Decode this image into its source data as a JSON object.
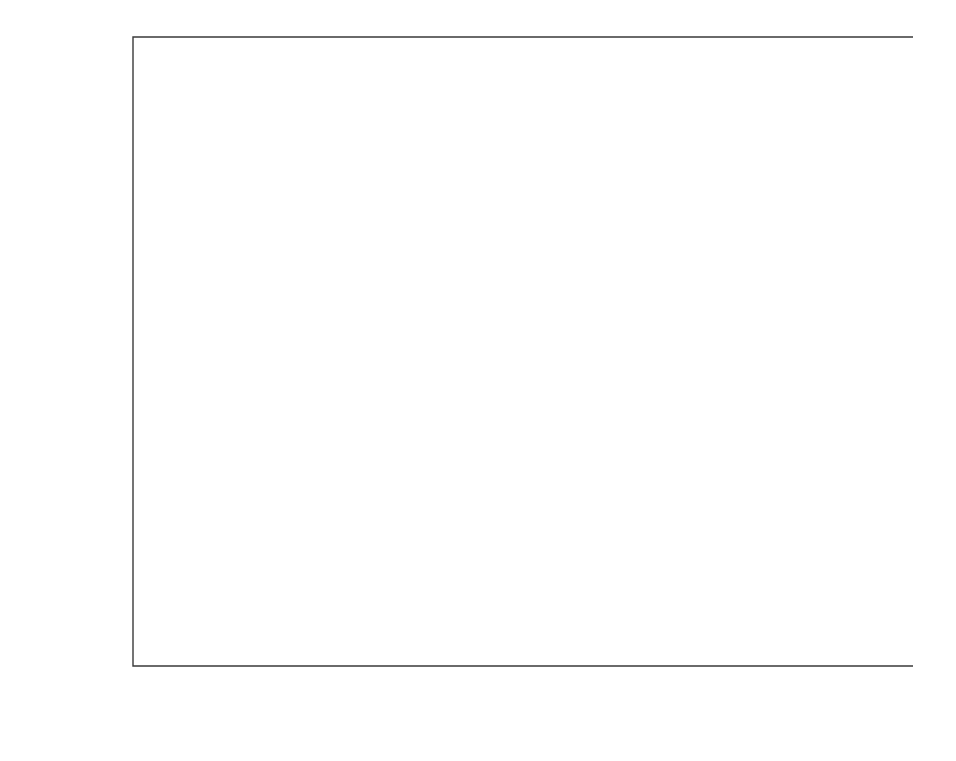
{
  "chart_data": {
    "type": "scatter",
    "title": "",
    "xlabel": "Experimental pressure (torr)",
    "ylabel": "Predicted pressure (torr)",
    "xlim": [
      0,
      232
    ],
    "ylim": [
      0,
      238
    ],
    "xticks": [
      0,
      50,
      100,
      150,
      200
    ],
    "yticks": [
      50,
      100,
      150,
      200
    ],
    "xtick_labels": [
      "0",
      "50",
      "100",
      "150",
      "200"
    ],
    "ytick_labels": [
      "50",
      "100",
      "150",
      "200"
    ],
    "grid": false,
    "legend_position": "lower-right",
    "reference_line": {
      "name": "parity line y = x",
      "from": [
        0,
        0
      ],
      "to": [
        232,
        232
      ]
    },
    "legend": [
      {
        "marker": "circle",
        "label": "NaBr – KBr"
      },
      {
        "marker": "square",
        "label": "NaCl – KCl"
      },
      {
        "marker": "triangle",
        "label": "NaCl – CaCl",
        "sub": "2"
      },
      {
        "marker": "dash",
        "label": "Pure water pressure"
      }
    ],
    "annotations": [
      {
        "text": "298.15K",
        "x": 23.6,
        "y": 23.6,
        "label_x": 20.5,
        "label_y": 23.6
      },
      {
        "text": "303.15 K",
        "x": 31.8,
        "y": 31.8,
        "label_x": 28.0,
        "label_y": 31.8
      },
      {
        "text": "308.15 K",
        "x": 42.2,
        "y": 42.2,
        "label_x": 38.0,
        "label_y": 42.2
      },
      {
        "text": "313.15K",
        "x": 55.3,
        "y": 55.3,
        "label_x": 51.5,
        "label_y": 55.3
      },
      {
        "text": "318.15K",
        "x": 71.9,
        "y": 71.9,
        "label_x": 67.0,
        "label_y": 71.9
      },
      {
        "text": "323.15K",
        "x": 92.5,
        "y": 92.5,
        "label_x": 87.5,
        "label_y": 92.5
      },
      {
        "text": "328.15K",
        "x": 118.0,
        "y": 118.0,
        "label_x": 112.0,
        "label_y": 118.0
      },
      {
        "text": "333.15K",
        "x": 149.4,
        "y": 149.4,
        "label_x": 143.0,
        "label_y": 149.4
      },
      {
        "text": "338.15K",
        "x": 187.5,
        "y": 187.5,
        "label_x": 181.0,
        "label_y": 187.5
      },
      {
        "text": "343.15K",
        "x": 233.7,
        "y": 233.7,
        "label_x": 226.0,
        "label_y": 233.7
      }
    ],
    "water_bars": [
      {
        "temperature": "298.15K",
        "pressure": 23.6,
        "x_start": 20.5,
        "x_end": 26.5
      },
      {
        "temperature": "303.15 K",
        "pressure": 31.8,
        "x_start": 28.0,
        "x_end": 34.5
      },
      {
        "temperature": "308.15 K",
        "pressure": 42.2,
        "x_start": 38.0,
        "x_end": 45.0
      },
      {
        "temperature": "313.15K",
        "pressure": 55.3,
        "x_start": 51.5,
        "x_end": 59.0
      },
      {
        "temperature": "318.15K",
        "pressure": 71.9,
        "x_start": 67.0,
        "x_end": 76.0
      },
      {
        "temperature": "323.15K",
        "pressure": 92.5,
        "x_start": 87.5,
        "x_end": 98.0
      },
      {
        "temperature": "328.15K",
        "pressure": 118.0,
        "x_start": 112.0,
        "x_end": 124.0
      },
      {
        "temperature": "333.15K",
        "pressure": 149.4,
        "x_start": 143.0,
        "x_end": 156.0
      },
      {
        "temperature": "338.15K",
        "pressure": 187.5,
        "x_start": 181.0,
        "x_end": 195.0
      },
      {
        "temperature": "343.15K",
        "pressure": 233.7,
        "x_start": 226.0,
        "x_end": 245.0
      }
    ],
    "series": [
      {
        "name": "NaBr – KBr",
        "marker": "circle",
        "points": [
          [
            21.9,
            22.3
          ],
          [
            22.4,
            22.7
          ],
          [
            22.9,
            23.1
          ],
          [
            23.3,
            23.4
          ],
          [
            29.6,
            30.1
          ],
          [
            30.2,
            30.5
          ],
          [
            30.8,
            31.0
          ],
          [
            31.3,
            31.5
          ],
          [
            39.4,
            39.9
          ],
          [
            40.1,
            40.5
          ],
          [
            40.8,
            41.1
          ],
          [
            41.4,
            41.6
          ],
          [
            51.7,
            52.3
          ],
          [
            52.6,
            53.0
          ],
          [
            53.4,
            53.8
          ],
          [
            54.2,
            54.5
          ],
          [
            67.2,
            67.9
          ],
          [
            68.3,
            68.8
          ],
          [
            69.4,
            69.8
          ],
          [
            70.3,
            70.7
          ],
          [
            86.5,
            87.3
          ],
          [
            87.9,
            88.5
          ],
          [
            89.2,
            89.8
          ],
          [
            90.4,
            90.9
          ],
          [
            110.4,
            111.3
          ],
          [
            112.1,
            112.9
          ],
          [
            113.8,
            114.4
          ],
          [
            115.2,
            115.9
          ],
          [
            139.7,
            140.8
          ],
          [
            141.9,
            142.8
          ],
          [
            144.0,
            144.8
          ],
          [
            145.8,
            146.6
          ],
          [
            175.2,
            176.5
          ],
          [
            178.0,
            179.1
          ],
          [
            180.6,
            181.6
          ],
          [
            182.9,
            183.8
          ],
          [
            218.4,
            219.9
          ],
          [
            221.8,
            223.1
          ],
          [
            225.0,
            226.2
          ],
          [
            227.8,
            228.9
          ]
        ]
      },
      {
        "name": "NaCl – KCl",
        "marker": "square",
        "points": [
          [
            20.2,
            20.6
          ],
          [
            21.6,
            22.0
          ],
          [
            22.6,
            23.0
          ],
          [
            23.4,
            23.7
          ],
          [
            27.4,
            27.9
          ],
          [
            29.2,
            29.7
          ],
          [
            30.5,
            30.9
          ],
          [
            31.4,
            31.7
          ],
          [
            36.5,
            37.1
          ],
          [
            38.9,
            39.4
          ],
          [
            40.5,
            41.0
          ],
          [
            41.7,
            42.0
          ],
          [
            48.1,
            48.8
          ],
          [
            51.1,
            51.8
          ],
          [
            53.2,
            53.8
          ],
          [
            54.7,
            55.1
          ],
          [
            62.6,
            63.5
          ],
          [
            66.5,
            67.3
          ],
          [
            69.1,
            69.8
          ],
          [
            71.0,
            71.6
          ],
          [
            80.8,
            81.9
          ],
          [
            85.7,
            86.7
          ],
          [
            89.1,
            90.0
          ],
          [
            91.5,
            92.2
          ],
          [
            103.2,
            104.5
          ],
          [
            109.4,
            110.6
          ],
          [
            113.7,
            114.8
          ],
          [
            116.8,
            117.7
          ],
          [
            130.7,
            132.3
          ],
          [
            138.5,
            140.0
          ],
          [
            143.9,
            145.3
          ],
          [
            147.8,
            149.0
          ],
          [
            164.0,
            166.0
          ],
          [
            173.7,
            175.6
          ],
          [
            180.5,
            182.2
          ],
          [
            185.4,
            187.0
          ],
          [
            204.5,
            207.0
          ],
          [
            216.5,
            219.0
          ],
          [
            225.0,
            227.2
          ],
          [
            231.0,
            233.0
          ]
        ]
      },
      {
        "name": "NaCl – CaCl2",
        "marker": "triangle",
        "points": [
          [
            21.2,
            21.5
          ],
          [
            21.8,
            22.1
          ],
          [
            22.4,
            22.6
          ],
          [
            22.9,
            23.1
          ],
          [
            28.7,
            29.0
          ],
          [
            29.4,
            29.7
          ],
          [
            30.1,
            30.4
          ],
          [
            30.8,
            31.0
          ],
          [
            38.2,
            38.6
          ],
          [
            39.1,
            39.5
          ],
          [
            40.0,
            40.3
          ],
          [
            40.9,
            41.1
          ],
          [
            50.1,
            50.6
          ],
          [
            51.3,
            51.7
          ],
          [
            52.4,
            52.8
          ],
          [
            53.5,
            53.8
          ],
          [
            65.2,
            65.8
          ],
          [
            66.7,
            67.2
          ],
          [
            68.1,
            68.6
          ],
          [
            69.5,
            69.9
          ],
          [
            83.9,
            84.6
          ],
          [
            85.8,
            86.4
          ],
          [
            87.6,
            88.2
          ],
          [
            89.4,
            89.9
          ],
          [
            107.1,
            108.0
          ],
          [
            109.5,
            110.2
          ],
          [
            111.8,
            112.5
          ],
          [
            114.0,
            114.6
          ],
          [
            135.5,
            136.6
          ],
          [
            138.5,
            139.5
          ],
          [
            141.5,
            142.3
          ],
          [
            144.2,
            145.0
          ],
          [
            170.1,
            171.4
          ],
          [
            173.9,
            175.1
          ],
          [
            177.5,
            178.6
          ],
          [
            180.9,
            181.9
          ],
          [
            211.8,
            213.4
          ],
          [
            216.5,
            217.9
          ],
          [
            221.0,
            222.3
          ],
          [
            225.2,
            226.3
          ]
        ]
      }
    ]
  }
}
